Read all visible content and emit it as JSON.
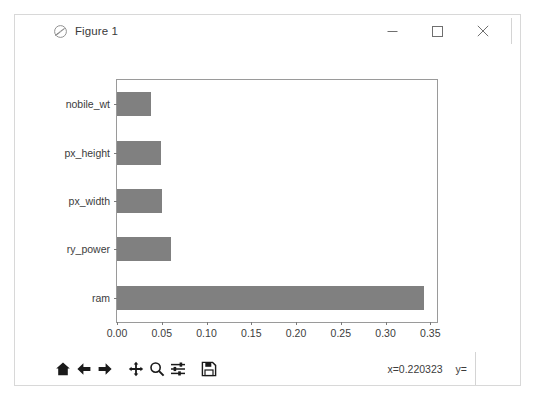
{
  "window": {
    "title": "Figure 1",
    "icon": "matplotlib-figure-icon",
    "controls": [
      {
        "name": "minimize",
        "glyph": "minimize-icon"
      },
      {
        "name": "maximize",
        "glyph": "maximize-icon"
      },
      {
        "name": "close",
        "glyph": "close-icon"
      }
    ]
  },
  "chart_data": {
    "type": "bar",
    "orientation": "horizontal",
    "title": "",
    "xlabel": "",
    "ylabel": "",
    "categories": [
      "ram",
      "battery_power",
      "px_width",
      "px_height",
      "mobile_wt"
    ],
    "display_categories": [
      "ram",
      "ry_power",
      "px_width",
      "px_height",
      "nobile_wt"
    ],
    "values": [
      0.343,
      0.06,
      0.05,
      0.049,
      0.038
    ],
    "xlim": [
      0.0,
      0.3575
    ],
    "ylim": [
      -0.5,
      4.5
    ],
    "xticks": [
      0.0,
      0.05,
      0.1,
      0.15,
      0.2,
      0.25,
      0.3,
      0.35
    ],
    "xticklabels": [
      "0.00",
      "0.05",
      "0.10",
      "0.15",
      "0.20",
      "0.25",
      "0.30",
      "0.35"
    ],
    "grid": false,
    "legend": null,
    "bar_color": "#808080"
  },
  "toolbar": {
    "buttons": [
      {
        "name": "home",
        "label": "Home",
        "icon": "home-icon"
      },
      {
        "name": "back",
        "label": "Back",
        "icon": "arrow-left-icon"
      },
      {
        "name": "forward",
        "label": "Forward",
        "icon": "arrow-right-icon"
      },
      {
        "name": "pan",
        "label": "Pan",
        "icon": "move-cross-icon"
      },
      {
        "name": "zoom",
        "label": "Zoom to rectangle",
        "icon": "magnifier-icon"
      },
      {
        "name": "configure",
        "label": "Configure subplots",
        "icon": "sliders-icon"
      },
      {
        "name": "save",
        "label": "Save the figure",
        "icon": "floppy-disk-icon"
      }
    ],
    "coords_x": "x=0.220323",
    "coords_y": "y="
  },
  "colors": {
    "bar": "#808080",
    "axis": "#9a9a9a",
    "text": "#3c3c3c",
    "window_border": "#d8d8d8",
    "background": "#ffffff"
  }
}
